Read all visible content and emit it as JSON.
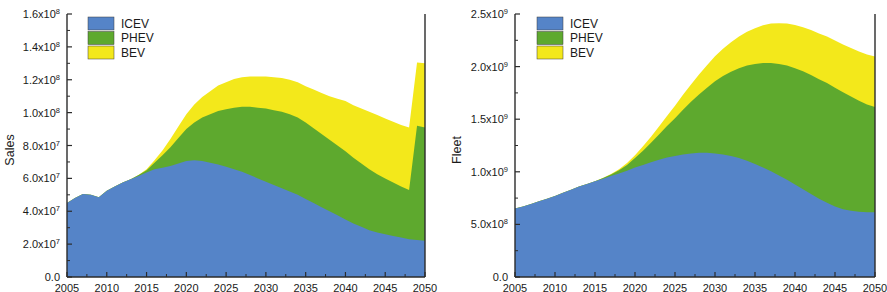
{
  "figure": {
    "panels": [
      "sales",
      "fleet"
    ]
  },
  "chart_data": [
    {
      "id": "sales",
      "type": "area",
      "stacked": true,
      "title": "",
      "xlabel": "",
      "ylabel": "Sales",
      "xlim": [
        2005,
        2050
      ],
      "ylim": [
        0,
        160000000
      ],
      "grid": false,
      "legend_position": "top-left",
      "y_tick_values": [
        0,
        20000000,
        40000000,
        60000000,
        80000000,
        100000000,
        120000000,
        140000000,
        160000000
      ],
      "y_tick_labels": [
        "0.0",
        "2.0x10^7",
        "4.0x10^7",
        "6.0x10^7",
        "8.0x10^7",
        "1.0x10^8",
        "1.2x10^8",
        "1.4x10^8",
        "1.6x10^8"
      ],
      "y_tick_mantissas": [
        "0.0",
        "2.0x10",
        "4.0x10",
        "6.0x10",
        "8.0x10",
        "1.0x10",
        "1.2x10",
        "1.4x10",
        "1.6x10"
      ],
      "y_tick_exponents": [
        "",
        "7",
        "7",
        "7",
        "7",
        "8",
        "8",
        "8",
        "8"
      ],
      "x_tick_values": [
        2005,
        2010,
        2015,
        2020,
        2025,
        2030,
        2035,
        2040,
        2045,
        2050
      ],
      "x_tick_labels": [
        "2005",
        "2010",
        "2015",
        "2020",
        "2025",
        "2030",
        "2035",
        "2040",
        "2045",
        "2050"
      ],
      "x": [
        2005,
        2006,
        2007,
        2008,
        2009,
        2010,
        2011,
        2012,
        2013,
        2014,
        2015,
        2016,
        2017,
        2018,
        2019,
        2020,
        2021,
        2022,
        2023,
        2024,
        2025,
        2026,
        2027,
        2028,
        2029,
        2030,
        2031,
        2032,
        2033,
        2034,
        2035,
        2036,
        2037,
        2038,
        2039,
        2040,
        2041,
        2042,
        2043,
        2044,
        2045,
        2046,
        2047,
        2048,
        2049,
        2050
      ],
      "series": [
        {
          "name": "ICEV",
          "color": "#5584C8",
          "values": [
            45000000,
            48000000,
            50500000,
            50000000,
            48500000,
            52500000,
            55000000,
            57500000,
            59500000,
            61500000,
            63500000,
            65500000,
            66500000,
            67500000,
            69000000,
            70500000,
            71000000,
            70500000,
            69500000,
            68500000,
            67000000,
            65500000,
            64000000,
            62000000,
            60000000,
            58000000,
            56000000,
            54000000,
            52000000,
            50000000,
            47500000,
            45000000,
            42500000,
            40000000,
            37500000,
            35000000,
            32500000,
            30500000,
            28500000,
            27000000,
            26000000,
            25000000,
            24000000,
            23000000,
            22500000,
            22000000
          ]
        },
        {
          "name": "PHEV",
          "color": "#5EA92E",
          "values": [
            0,
            0,
            0,
            0,
            0,
            0,
            0,
            0,
            0,
            500000,
            1500000,
            4000000,
            7500000,
            11500000,
            15500000,
            19500000,
            23000000,
            26500000,
            29500000,
            32500000,
            35000000,
            37500000,
            39500000,
            41500000,
            43000000,
            44500000,
            45500000,
            46500000,
            47000000,
            47000000,
            46500000,
            45500000,
            44500000,
            43500000,
            42500000,
            41500000,
            40000000,
            38500000,
            37000000,
            35500000,
            34000000,
            32500000,
            31000000,
            30000000,
            69500000,
            69000000
          ]
        },
        {
          "name": "BEV",
          "color": "#F3E81B",
          "values": [
            0,
            0,
            0,
            0,
            0,
            0,
            0,
            0,
            0,
            0,
            500000,
            1500000,
            3000000,
            5000000,
            7000000,
            9000000,
            11000000,
            12500000,
            14000000,
            15500000,
            16500000,
            17500000,
            18000000,
            18500000,
            19000000,
            19500000,
            20000000,
            20500000,
            21000000,
            21500000,
            22000000,
            23500000,
            25000000,
            26500000,
            28500000,
            30500000,
            32000000,
            33500000,
            35000000,
            36000000,
            36500000,
            37000000,
            37500000,
            38000000,
            38500000,
            39000000
          ]
        }
      ],
      "boundaries": {
        "note": "cumulative stacked tops read from plot",
        "icev_top_2005": 45000000,
        "icev_peak_2020": 71000000,
        "icev_top_2050": 22000000,
        "phev_top_2035": 113000000,
        "phev_top_2050": 91000000,
        "total_peak_2040": 133000000,
        "total_2050": 130000000
      }
    },
    {
      "id": "fleet",
      "type": "area",
      "stacked": true,
      "title": "",
      "xlabel": "",
      "ylabel": "Fleet",
      "xlim": [
        2005,
        2050
      ],
      "ylim": [
        0,
        2500000000
      ],
      "grid": false,
      "legend_position": "top-left",
      "y_tick_values": [
        0,
        500000000,
        1000000000,
        1500000000,
        2000000000,
        2500000000
      ],
      "y_tick_labels": [
        "0.0",
        "5.0x10^8",
        "1.0x10^9",
        "1.5x10^9",
        "2.0x10^9",
        "2.5x10^9"
      ],
      "y_tick_mantissas": [
        "0.0",
        "5.0x10",
        "1.0x10",
        "1.5x10",
        "2.0x10",
        "2.5x10"
      ],
      "y_tick_exponents": [
        "",
        "8",
        "9",
        "9",
        "9",
        "9"
      ],
      "x_tick_values": [
        2005,
        2010,
        2015,
        2020,
        2025,
        2030,
        2035,
        2040,
        2045,
        2050
      ],
      "x_tick_labels": [
        "2005",
        "2010",
        "2015",
        "2020",
        "2025",
        "2030",
        "2035",
        "2040",
        "2045",
        "2050"
      ],
      "x": [
        2005,
        2006,
        2007,
        2008,
        2009,
        2010,
        2011,
        2012,
        2013,
        2014,
        2015,
        2016,
        2017,
        2018,
        2019,
        2020,
        2021,
        2022,
        2023,
        2024,
        2025,
        2026,
        2027,
        2028,
        2029,
        2030,
        2031,
        2032,
        2033,
        2034,
        2035,
        2036,
        2037,
        2038,
        2039,
        2040,
        2041,
        2042,
        2043,
        2044,
        2045,
        2046,
        2047,
        2048,
        2049,
        2050
      ],
      "series": [
        {
          "name": "ICEV",
          "color": "#5584C8",
          "values": [
            650000000,
            670000000,
            695000000,
            720000000,
            745000000,
            770000000,
            800000000,
            830000000,
            860000000,
            885000000,
            910000000,
            935000000,
            960000000,
            985000000,
            1010000000,
            1040000000,
            1065000000,
            1090000000,
            1115000000,
            1135000000,
            1150000000,
            1165000000,
            1175000000,
            1180000000,
            1180000000,
            1175000000,
            1165000000,
            1150000000,
            1130000000,
            1105000000,
            1075000000,
            1040000000,
            1005000000,
            965000000,
            925000000,
            880000000,
            835000000,
            790000000,
            745000000,
            705000000,
            670000000,
            645000000,
            630000000,
            620000000,
            615000000,
            615000000
          ]
        },
        {
          "name": "PHEV",
          "color": "#5EA92E",
          "values": [
            0,
            0,
            0,
            0,
            0,
            0,
            0,
            0,
            0,
            0,
            0,
            5000000,
            15000000,
            30000000,
            55000000,
            90000000,
            135000000,
            185000000,
            240000000,
            300000000,
            360000000,
            425000000,
            490000000,
            555000000,
            620000000,
            685000000,
            745000000,
            800000000,
            855000000,
            905000000,
            950000000,
            995000000,
            1030000000,
            1060000000,
            1085000000,
            1105000000,
            1120000000,
            1130000000,
            1135000000,
            1140000000,
            1130000000,
            1110000000,
            1085000000,
            1055000000,
            1025000000,
            1000000000
          ]
        },
        {
          "name": "BEV",
          "color": "#F3E81B",
          "values": [
            0,
            0,
            0,
            0,
            0,
            0,
            0,
            0,
            0,
            0,
            0,
            2000000,
            5000000,
            10000000,
            18000000,
            28000000,
            42000000,
            58000000,
            76000000,
            96000000,
            118000000,
            142000000,
            166000000,
            190000000,
            214000000,
            238000000,
            260000000,
            282000000,
            302000000,
            322000000,
            340000000,
            358000000,
            374000000,
            388000000,
            400000000,
            410000000,
            420000000,
            428000000,
            435000000,
            441000000,
            448000000,
            455000000,
            462000000,
            468000000,
            474000000,
            480000000
          ]
        }
      ],
      "boundaries": {
        "note": "cumulative stacked tops read from plot",
        "icev_top_2005": 650000000,
        "icev_peak_2028": 1180000000,
        "icev_top_2050": 615000000,
        "phev_top_2044": 1890000000,
        "phev_top_2050": 1830000000,
        "total_2050": 2270000000
      }
    }
  ],
  "legend": {
    "entries": [
      {
        "label": "ICEV",
        "color": "#5584C8"
      },
      {
        "label": "PHEV",
        "color": "#5EA92E"
      },
      {
        "label": "BEV",
        "color": "#F3E81B"
      }
    ]
  }
}
